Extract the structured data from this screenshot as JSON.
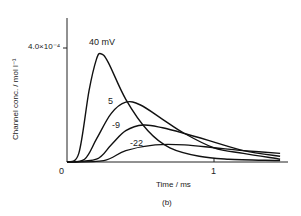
{
  "chart_data": {
    "type": "line",
    "title": "",
    "panel_label": "(b)",
    "xlabel": "Time / ms",
    "ylabel": "Channel conc. / mol l⁻¹",
    "x_ticks": [
      "0",
      "1"
    ],
    "y_ticks": [
      "4.0×10⁻⁴"
    ],
    "xlim": [
      0,
      1.45
    ],
    "ylim": [
      0,
      0.00055
    ],
    "grid": false,
    "legend": "inline labels",
    "series": [
      {
        "name": "40 mV",
        "label": "40 mV",
        "peak_time_ms": 0.23,
        "peak_value": 0.00038,
        "x": [
          0,
          0.08,
          0.15,
          0.2,
          0.23,
          0.28,
          0.4,
          0.55,
          0.7,
          0.9,
          1.1,
          1.45
        ],
        "y": [
          0,
          3e-05,
          0.00025,
          0.00036,
          0.00038,
          0.00035,
          0.00022,
          0.00011,
          5e-05,
          2e-05,
          1e-05,
          5e-06
        ]
      },
      {
        "name": "5 mV",
        "label": "5",
        "peak_time_ms": 0.4,
        "peak_value": 0.00021,
        "x": [
          0,
          0.12,
          0.2,
          0.3,
          0.4,
          0.5,
          0.65,
          0.8,
          1.0,
          1.2,
          1.45
        ],
        "y": [
          0,
          1e-05,
          8e-05,
          0.00017,
          0.00021,
          0.0002,
          0.00015,
          0.0001,
          5e-05,
          3e-05,
          1e-05
        ]
      },
      {
        "name": "-9 mV",
        "label": "-9",
        "peak_time_ms": 0.52,
        "peak_value": 0.00013,
        "x": [
          0,
          0.2,
          0.3,
          0.4,
          0.52,
          0.65,
          0.8,
          1.0,
          1.2,
          1.45
        ],
        "y": [
          0,
          1e-05,
          6e-05,
          0.00011,
          0.00013,
          0.00012,
          0.0001,
          7e-05,
          4e-05,
          2e-05
        ]
      },
      {
        "name": "-22 mV",
        "label": "-22",
        "peak_time_ms": 0.6,
        "peak_value": 6e-05,
        "x": [
          0,
          0.25,
          0.4,
          0.6,
          0.8,
          1.0,
          1.2,
          1.45
        ],
        "y": [
          0,
          5e-06,
          4e-05,
          6e-05,
          6e-05,
          5e-05,
          4e-05,
          3e-05
        ]
      }
    ]
  }
}
